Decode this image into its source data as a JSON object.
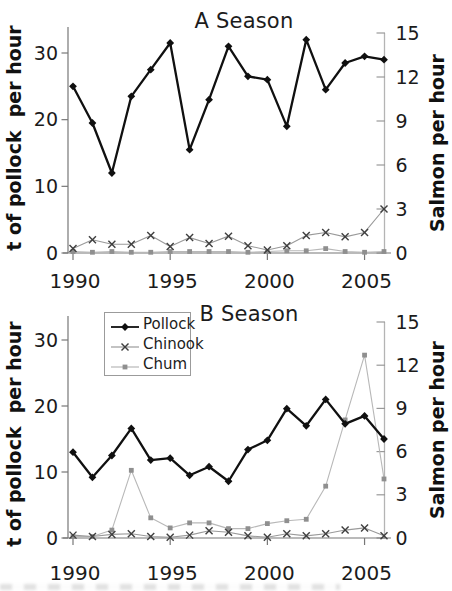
{
  "chart_data": [
    {
      "type": "line",
      "title": "A Season",
      "x": [
        1990,
        1991,
        1992,
        1993,
        1994,
        1995,
        1996,
        1997,
        1998,
        1999,
        2000,
        2001,
        2002,
        2003,
        2004,
        2005,
        2006
      ],
      "x_ticks": [
        "1990",
        "1995",
        "2000",
        "2005"
      ],
      "x_tick_years": [
        1990,
        1995,
        2000,
        2005
      ],
      "left_axis": {
        "label": "t of pollock  per hour",
        "ticks": [
          0,
          10,
          20,
          30
        ],
        "range": [
          0,
          33
        ]
      },
      "right_axis": {
        "label": "Salmon per hour",
        "ticks": [
          0,
          3,
          6,
          9,
          12,
          15
        ],
        "range": [
          0,
          15
        ]
      },
      "series": [
        {
          "name": "Pollock",
          "axis": "left",
          "marker": "diamond",
          "line_color": "#101010",
          "marker_color": "#101010",
          "line_width": 2.3,
          "values": [
            25,
            19.5,
            12,
            23.5,
            27.5,
            31.5,
            15.5,
            23,
            31,
            26.5,
            26,
            19,
            32,
            24.5,
            28.5,
            29.5,
            29
          ]
        },
        {
          "name": "Chinook",
          "axis": "right",
          "marker": "x",
          "line_color": "#9a9a9a",
          "marker_color": "#3f3f3f",
          "line_width": 1.1,
          "values": [
            0.3,
            0.9,
            0.6,
            0.6,
            1.2,
            0.45,
            1.05,
            0.65,
            1.15,
            0.5,
            0.2,
            0.5,
            1.2,
            1.4,
            1.1,
            1.4,
            3.0
          ]
        },
        {
          "name": "Chum",
          "axis": "right",
          "marker": "square",
          "line_color": "#b8b8b8",
          "marker_color": "#8f8f8f",
          "line_width": 1.1,
          "values": [
            0.1,
            0.05,
            0.1,
            0.05,
            0.05,
            0.1,
            0.1,
            0.1,
            0.1,
            0.05,
            0.1,
            0.15,
            0.15,
            0.3,
            0.1,
            0.05,
            0.1
          ]
        }
      ],
      "legend": null
    },
    {
      "type": "line",
      "title": "B Season",
      "x": [
        1990,
        1991,
        1992,
        1993,
        1994,
        1995,
        1996,
        1997,
        1998,
        1999,
        2000,
        2001,
        2002,
        2003,
        2004,
        2005,
        2006
      ],
      "x_ticks": [
        "1990",
        "1995",
        "2000",
        "2005"
      ],
      "x_tick_years": [
        1990,
        1995,
        2000,
        2005
      ],
      "left_axis": {
        "label": "t of pollock  per hour",
        "ticks": [
          0,
          10,
          20,
          30
        ],
        "range": [
          0,
          33
        ]
      },
      "right_axis": {
        "label": "Salmon per hour",
        "ticks": [
          0,
          3,
          6,
          9,
          12,
          15
        ],
        "range": [
          0,
          15
        ]
      },
      "series": [
        {
          "name": "Pollock",
          "axis": "left",
          "marker": "diamond",
          "line_color": "#101010",
          "marker_color": "#101010",
          "line_width": 2.3,
          "values": [
            13,
            9.2,
            12.5,
            16.6,
            11.8,
            12.1,
            9.5,
            10.8,
            8.6,
            13.4,
            14.8,
            19.6,
            17,
            21,
            17.3,
            18.5,
            15
          ]
        },
        {
          "name": "Chinook",
          "axis": "right",
          "marker": "x",
          "line_color": "#9a9a9a",
          "marker_color": "#3f3f3f",
          "line_width": 1.1,
          "values": [
            0.2,
            0.1,
            0.25,
            0.3,
            0.1,
            0.05,
            0.2,
            0.5,
            0.4,
            0.15,
            0.05,
            0.3,
            0.15,
            0.3,
            0.55,
            0.7,
            0.15
          ]
        },
        {
          "name": "Chum",
          "axis": "right",
          "marker": "square",
          "line_color": "#b8b8b8",
          "marker_color": "#8f8f8f",
          "line_width": 1.1,
          "values": [
            0.1,
            0.1,
            0.55,
            4.7,
            1.4,
            0.7,
            1.05,
            1.05,
            0.65,
            0.65,
            1.0,
            1.2,
            1.3,
            3.6,
            8.2,
            12.7,
            4.1
          ]
        }
      ],
      "legend": {
        "position": "top-left",
        "items": [
          "Pollock",
          "Chinook",
          "Chum"
        ]
      }
    }
  ],
  "colors": {
    "text": "#1b1b1b",
    "axis": "#777777",
    "right_axis_line": "#b4b4b4",
    "legend_border": "#9b9b9b"
  }
}
